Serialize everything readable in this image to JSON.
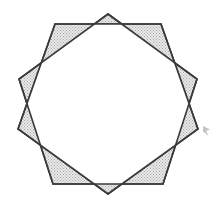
{
  "figure": {
    "canvas": {
      "width": 218,
      "height": 207,
      "background_color": "#ffffff"
    },
    "style": {
      "fill_color": "#dcdcdc",
      "fill_pattern": "stipple-dots",
      "stipple_dot_color": "#a8a8a8",
      "stroke_color": "#3a3a3a",
      "stroke_width": 1.6,
      "inner_region_color": "#ffffff"
    },
    "geometry": {
      "center_x": 108,
      "center_y": 104,
      "circumradius": 90,
      "shape_count": 2,
      "sides_per_shape": 5,
      "star_points": 10,
      "pentagon_a_rotation_deg": -90,
      "pentagon_b_rotation_deg": -54
    },
    "pentagon_a": {
      "name": "pentagon-upright",
      "label": "Pentagon A",
      "vertices": [
        [
          108,
          14
        ],
        [
          197,
          79
        ],
        [
          163,
          184
        ],
        [
          53,
          184
        ],
        [
          19,
          79
        ]
      ]
    },
    "pentagon_b": {
      "name": "pentagon-rotated",
      "label": "Pentagon B",
      "vertices": [
        [
          161,
          24
        ],
        [
          198,
          129
        ],
        [
          108,
          194
        ],
        [
          18,
          129
        ],
        [
          55,
          24
        ]
      ]
    },
    "artifact": {
      "name": "scan-artifact",
      "label": "faint scan speck",
      "visible": true,
      "x": 203,
      "y": 126,
      "width": 7,
      "height": 10,
      "color": "#b0b0b0"
    }
  }
}
